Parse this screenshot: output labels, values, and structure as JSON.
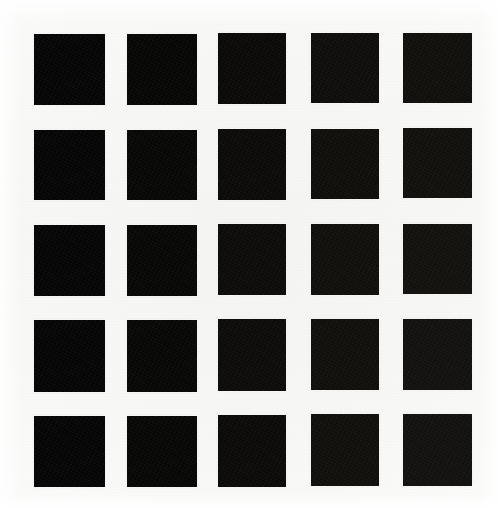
{
  "image": {
    "kind": "scanned-test-pattern",
    "description": "5 by 5 grid of solid black squares on white scanned paper",
    "width": 498,
    "height": 508,
    "background_color": "#ffffff",
    "paper_color": "#f6f6f4"
  },
  "grid": {
    "rows": 5,
    "columns": 5,
    "patch_count": 25,
    "column_left_edges": [
      34,
      127,
      218,
      311,
      403
    ],
    "row_top_edges": [
      34,
      130,
      225,
      320,
      416
    ],
    "patch_width": 71,
    "patch_height": 71,
    "column_gap": 22,
    "row_gap": 24,
    "patch_color": "#050505"
  },
  "patches": [
    {
      "id": "r1c1",
      "row": 1,
      "col": 1,
      "x": 34,
      "y": 34,
      "w": 71,
      "h": 71,
      "color": "#050505"
    },
    {
      "id": "r1c2",
      "row": 1,
      "col": 2,
      "x": 127,
      "y": 34,
      "w": 70,
      "h": 71,
      "color": "#060605"
    },
    {
      "id": "r1c3",
      "row": 1,
      "col": 3,
      "x": 218,
      "y": 33,
      "w": 68,
      "h": 71,
      "color": "#0a0908"
    },
    {
      "id": "r1c4",
      "row": 1,
      "col": 4,
      "x": 311,
      "y": 33,
      "w": 68,
      "h": 70,
      "color": "#0e0d0b"
    },
    {
      "id": "r1c5",
      "row": 1,
      "col": 5,
      "x": 403,
      "y": 33,
      "w": 69,
      "h": 70,
      "color": "#100f0c"
    },
    {
      "id": "r2c1",
      "row": 2,
      "col": 1,
      "x": 34,
      "y": 130,
      "w": 71,
      "h": 70,
      "color": "#050505"
    },
    {
      "id": "r2c2",
      "row": 2,
      "col": 2,
      "x": 127,
      "y": 130,
      "w": 70,
      "h": 70,
      "color": "#070706"
    },
    {
      "id": "r2c3",
      "row": 2,
      "col": 3,
      "x": 218,
      "y": 129,
      "w": 68,
      "h": 71,
      "color": "#0b0a09"
    },
    {
      "id": "r2c4",
      "row": 2,
      "col": 4,
      "x": 311,
      "y": 129,
      "w": 68,
      "h": 70,
      "color": "#0f0e0b"
    },
    {
      "id": "r2c5",
      "row": 2,
      "col": 5,
      "x": 403,
      "y": 128,
      "w": 69,
      "h": 70,
      "color": "#11100d"
    },
    {
      "id": "r3c1",
      "row": 3,
      "col": 1,
      "x": 34,
      "y": 225,
      "w": 71,
      "h": 71,
      "color": "#050505"
    },
    {
      "id": "r3c2",
      "row": 3,
      "col": 2,
      "x": 127,
      "y": 225,
      "w": 70,
      "h": 71,
      "color": "#070706"
    },
    {
      "id": "r3c3",
      "row": 3,
      "col": 3,
      "x": 218,
      "y": 224,
      "w": 68,
      "h": 71,
      "color": "#0c0b09"
    },
    {
      "id": "r3c4",
      "row": 3,
      "col": 4,
      "x": 311,
      "y": 224,
      "w": 68,
      "h": 71,
      "color": "#100f0c"
    },
    {
      "id": "r3c5",
      "row": 3,
      "col": 5,
      "x": 403,
      "y": 224,
      "w": 69,
      "h": 70,
      "color": "#12110e"
    },
    {
      "id": "r4c1",
      "row": 4,
      "col": 1,
      "x": 34,
      "y": 320,
      "w": 71,
      "h": 72,
      "color": "#050505"
    },
    {
      "id": "r4c2",
      "row": 4,
      "col": 2,
      "x": 127,
      "y": 320,
      "w": 70,
      "h": 72,
      "color": "#070706"
    },
    {
      "id": "r4c3",
      "row": 4,
      "col": 3,
      "x": 218,
      "y": 319,
      "w": 68,
      "h": 72,
      "color": "#0c0b09"
    },
    {
      "id": "r4c4",
      "row": 4,
      "col": 4,
      "x": 311,
      "y": 319,
      "w": 68,
      "h": 71,
      "color": "#100f0c"
    },
    {
      "id": "r4c5",
      "row": 4,
      "col": 5,
      "x": 403,
      "y": 319,
      "w": 69,
      "h": 71,
      "color": "#121110"
    },
    {
      "id": "r5c1",
      "row": 5,
      "col": 1,
      "x": 34,
      "y": 416,
      "w": 71,
      "h": 71,
      "color": "#050505"
    },
    {
      "id": "r5c2",
      "row": 5,
      "col": 2,
      "x": 127,
      "y": 416,
      "w": 70,
      "h": 71,
      "color": "#070706"
    },
    {
      "id": "r5c3",
      "row": 5,
      "col": 3,
      "x": 218,
      "y": 415,
      "w": 68,
      "h": 72,
      "color": "#0b0a09"
    },
    {
      "id": "r5c4",
      "row": 5,
      "col": 4,
      "x": 311,
      "y": 414,
      "w": 68,
      "h": 72,
      "color": "#100f0c"
    },
    {
      "id": "r5c5",
      "row": 5,
      "col": 5,
      "x": 403,
      "y": 414,
      "w": 69,
      "h": 72,
      "color": "#121110"
    }
  ]
}
